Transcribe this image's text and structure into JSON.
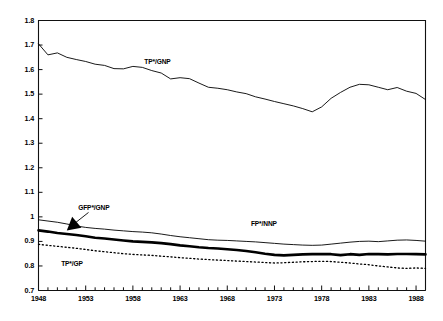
{
  "chart_data": {
    "type": "line",
    "title": "",
    "xlabel": "",
    "ylabel": "",
    "xlim": [
      1948,
      1989
    ],
    "ylim": [
      0.7,
      1.8
    ],
    "grid": false,
    "legend_position": "inline-annotations",
    "y_ticks": [
      "1.8",
      "1.7",
      "1.6",
      "1.5",
      "1.4",
      "1.3",
      "1.2",
      "1.1",
      "1",
      "0.9",
      "0.8",
      "0.7"
    ],
    "y_tick_values": [
      1.8,
      1.7,
      1.6,
      1.5,
      1.4,
      1.3,
      1.2,
      1.1,
      1.0,
      0.9,
      0.8,
      0.7
    ],
    "x_ticks": [
      "1948",
      "1953",
      "1958",
      "1963",
      "1968",
      "1973",
      "1978",
      "1983",
      "1988"
    ],
    "x_tick_values": [
      1948,
      1953,
      1958,
      1963,
      1968,
      1973,
      1978,
      1983,
      1988
    ],
    "x_minor_tick_interval": 1,
    "x": [
      1948,
      1949,
      1950,
      1951,
      1952,
      1953,
      1954,
      1955,
      1956,
      1957,
      1958,
      1959,
      1960,
      1961,
      1962,
      1963,
      1964,
      1965,
      1966,
      1967,
      1968,
      1969,
      1970,
      1971,
      1972,
      1973,
      1974,
      1975,
      1976,
      1977,
      1978,
      1979,
      1980,
      1981,
      1982,
      1983,
      1984,
      1985,
      1986,
      1987,
      1988,
      1989
    ],
    "series": [
      {
        "name": "TP*/GNP",
        "style": "thin-solid",
        "color": "#000000",
        "line_width": 0.9,
        "label_x": 1959.2,
        "label_y": 1.625,
        "values": [
          1.705,
          1.66,
          1.668,
          1.65,
          1.641,
          1.633,
          1.622,
          1.617,
          1.604,
          1.603,
          1.613,
          1.609,
          1.596,
          1.586,
          1.562,
          1.567,
          1.563,
          1.545,
          1.528,
          1.524,
          1.518,
          1.509,
          1.502,
          1.489,
          1.48,
          1.47,
          1.461,
          1.452,
          1.441,
          1.428,
          1.448,
          1.483,
          1.507,
          1.528,
          1.54,
          1.538,
          1.528,
          1.518,
          1.527,
          1.512,
          1.503,
          1.478
        ]
      },
      {
        "name": "FP*/NNP",
        "style": "thin-solid",
        "color": "#000000",
        "line_width": 0.9,
        "label_x": 1970.5,
        "label_y": 0.965,
        "values": [
          0.988,
          0.983,
          0.978,
          0.971,
          0.963,
          0.957,
          0.953,
          0.95,
          0.946,
          0.943,
          0.94,
          0.938,
          0.935,
          0.93,
          0.924,
          0.919,
          0.915,
          0.911,
          0.907,
          0.905,
          0.904,
          0.902,
          0.9,
          0.898,
          0.895,
          0.892,
          0.889,
          0.887,
          0.885,
          0.884,
          0.885,
          0.889,
          0.893,
          0.897,
          0.9,
          0.901,
          0.899,
          0.902,
          0.905,
          0.906,
          0.904,
          0.901
        ]
      },
      {
        "name": "GFP*/GNP",
        "style": "thick-solid",
        "color": "#000000",
        "line_width": 2.6,
        "label_x": 1952.2,
        "label_y": 1.032,
        "arrow_from_x": 1953.3,
        "arrow_from_y": 1.018,
        "arrow_to_x": 1951.0,
        "arrow_to_y": 0.944,
        "values": [
          0.945,
          0.94,
          0.934,
          0.93,
          0.926,
          0.921,
          0.915,
          0.912,
          0.908,
          0.904,
          0.9,
          0.898,
          0.896,
          0.893,
          0.889,
          0.884,
          0.88,
          0.876,
          0.873,
          0.871,
          0.868,
          0.865,
          0.861,
          0.856,
          0.85,
          0.845,
          0.843,
          0.845,
          0.847,
          0.848,
          0.849,
          0.848,
          0.844,
          0.848,
          0.845,
          0.849,
          0.848,
          0.847,
          0.849,
          0.849,
          0.848,
          0.847
        ]
      },
      {
        "name": "TP*/GP",
        "style": "dotted",
        "color": "#000000",
        "line_width": 1.3,
        "label_x": 1950.4,
        "label_y": 0.802,
        "values": [
          0.888,
          0.884,
          0.88,
          0.876,
          0.872,
          0.867,
          0.862,
          0.858,
          0.854,
          0.85,
          0.847,
          0.845,
          0.843,
          0.84,
          0.837,
          0.834,
          0.831,
          0.828,
          0.826,
          0.824,
          0.822,
          0.82,
          0.818,
          0.816,
          0.814,
          0.812,
          0.813,
          0.815,
          0.817,
          0.818,
          0.819,
          0.818,
          0.815,
          0.812,
          0.808,
          0.805,
          0.8,
          0.796,
          0.792,
          0.79,
          0.792,
          0.79
        ]
      }
    ]
  }
}
